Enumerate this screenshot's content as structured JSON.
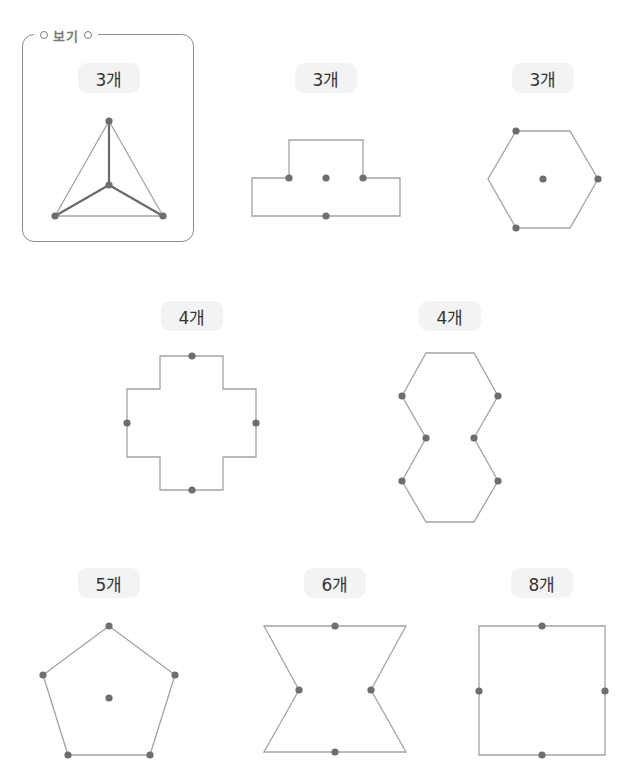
{
  "example": {
    "title": "보기",
    "label": "3개"
  },
  "colors": {
    "outline": "#a3a3a3",
    "dot": "#6e6e6e",
    "guide": "#6a6a6a",
    "pill_bg": "#f3f3f3",
    "frame": "#8c8c8c"
  },
  "figures": [
    {
      "id": "example-triangle",
      "label": "3개",
      "label_pos": [
        109,
        78
      ],
      "polygon": [
        [
          109,
          121
        ],
        [
          163,
          216
        ],
        [
          55,
          216
        ]
      ],
      "dots": [
        [
          109,
          121
        ],
        [
          55,
          216
        ],
        [
          163,
          216
        ],
        [
          109,
          185
        ]
      ],
      "guides": [
        [
          [
            109,
            185
          ],
          [
            109,
            121
          ]
        ],
        [
          [
            109,
            185
          ],
          [
            55,
            216
          ]
        ],
        [
          [
            109,
            185
          ],
          [
            163,
            216
          ]
        ]
      ]
    },
    {
      "id": "t-shape",
      "label": "3개",
      "label_pos": [
        326,
        78
      ],
      "polygon": [
        [
          289,
          140
        ],
        [
          363,
          140
        ],
        [
          363,
          178
        ],
        [
          400,
          178
        ],
        [
          400,
          216
        ],
        [
          252,
          216
        ],
        [
          252,
          178
        ],
        [
          289,
          178
        ]
      ],
      "dots": [
        [
          289,
          178
        ],
        [
          326,
          178
        ],
        [
          363,
          178
        ],
        [
          326,
          216
        ]
      ],
      "guides": []
    },
    {
      "id": "hexagon",
      "label": "3개",
      "label_pos": [
        543,
        78
      ],
      "polygon": [
        [
          516,
          131
        ],
        [
          570,
          131
        ],
        [
          598,
          179
        ],
        [
          570,
          228
        ],
        [
          516,
          228
        ],
        [
          488,
          179
        ]
      ],
      "dots": [
        [
          516,
          131
        ],
        [
          543,
          179
        ],
        [
          598,
          179
        ],
        [
          516,
          228
        ]
      ],
      "guides": []
    },
    {
      "id": "cross",
      "label": "4개",
      "label_pos": [
        192,
        316
      ],
      "polygon": [
        [
          160,
          356
        ],
        [
          223,
          356
        ],
        [
          223,
          389
        ],
        [
          256,
          389
        ],
        [
          256,
          457
        ],
        [
          223,
          457
        ],
        [
          223,
          490
        ],
        [
          160,
          490
        ],
        [
          160,
          457
        ],
        [
          127,
          457
        ],
        [
          127,
          389
        ],
        [
          160,
          389
        ]
      ],
      "dots": [
        [
          192,
          356
        ],
        [
          127,
          423
        ],
        [
          256,
          423
        ],
        [
          192,
          490
        ]
      ],
      "guides": []
    },
    {
      "id": "double-hexagon",
      "label": "4개",
      "label_pos": [
        450,
        316
      ],
      "polygon": [
        [
          426,
          353
        ],
        [
          474,
          353
        ],
        [
          498,
          396
        ],
        [
          474,
          438
        ],
        [
          498,
          481
        ],
        [
          474,
          522
        ],
        [
          426,
          522
        ],
        [
          402,
          481
        ],
        [
          426,
          438
        ],
        [
          402,
          396
        ]
      ],
      "dots": [
        [
          402,
          396
        ],
        [
          498,
          396
        ],
        [
          426,
          438
        ],
        [
          474,
          438
        ],
        [
          402,
          481
        ],
        [
          498,
          481
        ]
      ],
      "guides": []
    },
    {
      "id": "pentagon",
      "label": "5개",
      "label_pos": [
        109,
        583
      ],
      "polygon": [
        [
          109,
          626
        ],
        [
          175,
          675
        ],
        [
          150,
          755
        ],
        [
          68,
          755
        ],
        [
          43,
          675
        ]
      ],
      "dots": [
        [
          109,
          626
        ],
        [
          43,
          675
        ],
        [
          175,
          675
        ],
        [
          68,
          755
        ],
        [
          150,
          755
        ],
        [
          109,
          698
        ]
      ],
      "guides": []
    },
    {
      "id": "hourglass",
      "label": "6개",
      "label_pos": [
        335,
        583
      ],
      "polygon": [
        [
          264,
          626
        ],
        [
          406,
          626
        ],
        [
          371,
          690
        ],
        [
          406,
          752
        ],
        [
          264,
          752
        ],
        [
          299,
          690
        ]
      ],
      "dots": [
        [
          335,
          626
        ],
        [
          299,
          690
        ],
        [
          371,
          690
        ],
        [
          335,
          752
        ]
      ],
      "guides": []
    },
    {
      "id": "square",
      "label": "8개",
      "label_pos": [
        542,
        583
      ],
      "polygon": [
        [
          479,
          626
        ],
        [
          605,
          626
        ],
        [
          605,
          755
        ],
        [
          479,
          755
        ]
      ],
      "dots": [
        [
          542,
          626
        ],
        [
          479,
          691
        ],
        [
          605,
          691
        ],
        [
          542,
          755
        ]
      ],
      "guides": []
    }
  ]
}
